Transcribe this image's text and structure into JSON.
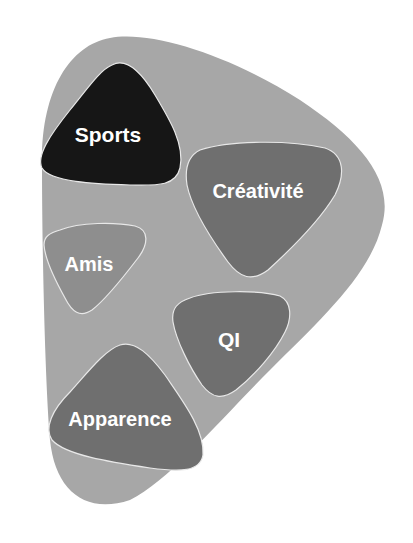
{
  "diagram": {
    "type": "nested-blobs",
    "container": {
      "label": "",
      "color": "#a7a7a7"
    },
    "items": [
      {
        "label": "Sports",
        "color": "#161616"
      },
      {
        "label": "Créativité",
        "color": "#6f6f6f"
      },
      {
        "label": "Amis",
        "color": "#8e8e8e"
      },
      {
        "label": "QI",
        "color": "#6f6f6f"
      },
      {
        "label": "Apparence",
        "color": "#6f6f6f"
      }
    ]
  }
}
